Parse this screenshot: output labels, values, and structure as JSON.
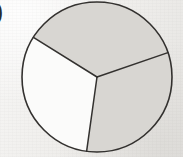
{
  "figure": {
    "kind": "fraction-circle-diagram",
    "label_fragment": ")",
    "background_color": "#f1f0ee",
    "outline_color": "#33312f",
    "outline_width": 1.6,
    "shaded_fill": "#d8d6d2",
    "unshaded_fill": "#fbfbfa",
    "circle": {
      "cx": 97,
      "cy": 77,
      "r": 75
    },
    "shaded_count": 2,
    "total_count": 3,
    "fraction_text": "2/3"
  },
  "chart_data": {
    "type": "pie",
    "title": "",
    "xlabel": "",
    "ylabel": "",
    "categories": [
      "top sector",
      "lower-right sector",
      "left sector"
    ],
    "values": [
      33.3,
      33.3,
      33.3
    ],
    "labels": [
      "",
      "",
      ""
    ],
    "colors": [
      "#d8d6d2",
      "#d8d6d2",
      "#fbfbfa"
    ],
    "shaded": [
      true,
      true,
      false
    ],
    "start_angle_deg": 148,
    "sector_boundary_angles_deg": [
      148,
      19,
      -98
    ],
    "legend": "none",
    "grid": false
  }
}
